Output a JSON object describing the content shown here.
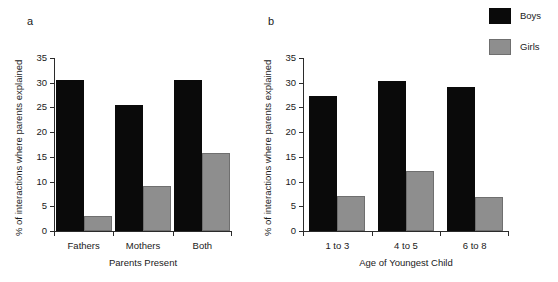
{
  "legend": {
    "entries": [
      {
        "label": "Boys",
        "color": "#0a0a0a"
      },
      {
        "label": "Girls",
        "color": "#8e8e8e"
      }
    ]
  },
  "panel_a": {
    "letter": "a",
    "chart_data": {
      "type": "bar",
      "title": "",
      "xlabel": "Parents Present",
      "ylabel": "% of interactions where parents explained",
      "categories": [
        "Fathers",
        "Mothers",
        "Both"
      ],
      "series": [
        {
          "name": "Boys",
          "color": "#0a0a0a",
          "values": [
            30.6,
            25.4,
            30.6
          ]
        },
        {
          "name": "Girls",
          "color": "#8e8e8e",
          "values": [
            3.0,
            9.1,
            15.7
          ]
        }
      ],
      "ylim": [
        0,
        35
      ],
      "yticks": [
        0,
        5,
        10,
        15,
        20,
        25,
        30,
        35
      ],
      "ytick_labels": [
        "0",
        "5",
        "10",
        "15",
        "20",
        "25",
        "30",
        "35"
      ],
      "grid": false,
      "legend_position": "top-right (shared)"
    }
  },
  "panel_b": {
    "letter": "b",
    "chart_data": {
      "type": "bar",
      "title": "",
      "xlabel": "Age of Youngest Child",
      "ylabel": "% of interactions where parents explained",
      "categories": [
        "1 to 3",
        "4 to 5",
        "6 to 8"
      ],
      "series": [
        {
          "name": "Boys",
          "color": "#0a0a0a",
          "values": [
            27.3,
            30.4,
            29.2
          ]
        },
        {
          "name": "Girls",
          "color": "#8e8e8e",
          "values": [
            7.0,
            12.1,
            6.8
          ]
        }
      ],
      "ylim": [
        0,
        35
      ],
      "yticks": [
        0,
        5,
        10,
        15,
        20,
        25,
        30,
        35
      ],
      "ytick_labels": [
        "0",
        "5",
        "10",
        "15",
        "20",
        "25",
        "30",
        "35"
      ],
      "grid": false,
      "legend_position": "top-right (shared)"
    }
  }
}
